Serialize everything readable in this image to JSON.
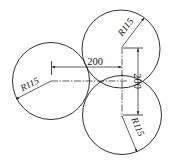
{
  "drawing": {
    "title": "Three circles R115 with 200 center spacing",
    "circles": [
      {
        "name": "left",
        "radius_label": "R115"
      },
      {
        "name": "top-right",
        "radius_label": "R115"
      },
      {
        "name": "bottom-right",
        "radius_label": "R115"
      }
    ],
    "dimensions": {
      "horizontal": "200",
      "vertical": "200"
    },
    "colors": {
      "line": "#1a1a1a",
      "background": "#ffffff"
    }
  }
}
